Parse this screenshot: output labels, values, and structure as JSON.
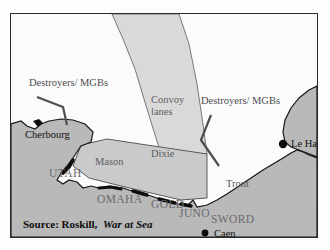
{
  "figure": {
    "name": "normandy-invasion-map",
    "source_prefix": "Source: Roskill,",
    "source_title": "War at Sea"
  },
  "colors": {
    "sea": "#fbfbfb",
    "land": "#b9b9b9",
    "assault_area": "#c9c9c9",
    "convoy_lane": "#d6d6d6",
    "coast_line": "#1a1a1a",
    "beach_marker": "#0d0d0d",
    "frame_border": "#2a2a2a",
    "label_gray": "#5d5d60",
    "label_black": "#111111"
  },
  "ports": [
    {
      "name": "Cherbourg",
      "label": "Cherbourg",
      "x": 24,
      "y": 118
    },
    {
      "name": "Le Havre",
      "label": "Le Havre",
      "x": 278,
      "y": 133
    },
    {
      "name": "Caen",
      "label": "Caen",
      "x": 205,
      "y": 222
    }
  ],
  "beaches": [
    {
      "name": "utah",
      "label": "UTAH",
      "x": 40,
      "y": 163
    },
    {
      "name": "omaha",
      "label": "OMAHA",
      "x": 88,
      "y": 189
    },
    {
      "name": "gold",
      "label": "GOLD",
      "x": 145,
      "y": 194
    },
    {
      "name": "juno",
      "label": "JUNO",
      "x": 175,
      "y": 203
    },
    {
      "name": "sword",
      "label": "SWORD",
      "x": 208,
      "y": 209
    }
  ],
  "zones": [
    {
      "name": "mason",
      "label": "Mason",
      "x": 84,
      "y": 151
    },
    {
      "name": "dixie",
      "label": "Dixie",
      "x": 140,
      "y": 143
    },
    {
      "name": "trout",
      "label": "Trout",
      "x": 215,
      "y": 173
    }
  ],
  "convoy_lanes": {
    "label_line1": "Convoy",
    "label_line2": "lanes",
    "x": 140,
    "y_line1": 89,
    "y_line2": 101
  },
  "screening_forces": [
    {
      "name": "destroyers-mgbs-west",
      "label": "Destroyers/ MGBs",
      "x": 18,
      "y": 72
    },
    {
      "name": "destroyers-mgbs-east",
      "label": "Destroyers/ MGBs",
      "x": 190,
      "y": 90
    }
  ],
  "map_data": {
    "type": "historical-map",
    "region": "English Channel / Normandy coast, France",
    "event": "Operation Neptune assault area, 6 June 1944",
    "features": [
      "Cotentin Peninsula with Cherbourg",
      "Normandy coastline with five landing beaches",
      "Seine estuary with Le Havre",
      "Convoy lane corridor from the north",
      "Mason and Dixie approach zones",
      "Trout screening line",
      "Destroyer / MGB screening flanks"
    ]
  }
}
